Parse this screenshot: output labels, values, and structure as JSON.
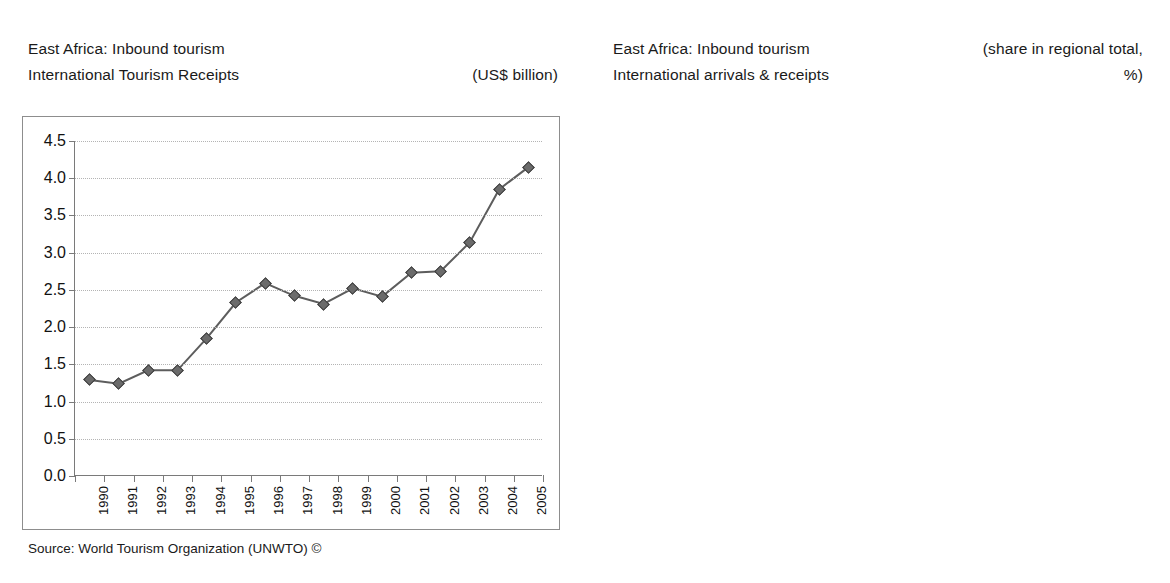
{
  "left_panel": {
    "title_line1": "East Africa: Inbound tourism",
    "title_line2": "International Tourism Receipts",
    "unit_line1": "",
    "unit_line2": "(US$ billion)",
    "source": "Source: World Tourism Organization (UNWTO) ©"
  },
  "right_panel": {
    "title_line1": "East Africa: Inbound tourism",
    "title_line2": "International arrivals & receipts",
    "unit_line1": "(share in regional total,",
    "unit_line2": "%)",
    "source": "Source: World Tourism Organization (UNWTO) ©"
  },
  "chart_data": [
    {
      "type": "line",
      "title": "East Africa: Inbound tourism — International Tourism Receipts",
      "xlabel": "",
      "ylabel": "(US$ billion)",
      "ylim": [
        0.0,
        4.5
      ],
      "ytick_labels": [
        "0.0",
        "0.5",
        "1.0",
        "1.5",
        "2.0",
        "2.5",
        "3.0",
        "3.5",
        "4.0",
        "4.5"
      ],
      "ytick_values": [
        0.0,
        0.5,
        1.0,
        1.5,
        2.0,
        2.5,
        3.0,
        3.5,
        4.0,
        4.5
      ],
      "grid": true,
      "legend": "none",
      "marker": "diamond",
      "categories": [
        "1990",
        "1991",
        "1992",
        "1993",
        "1994",
        "1995",
        "1996",
        "1997",
        "1998",
        "1999",
        "2000",
        "2001",
        "2002",
        "2003",
        "2004",
        "2005"
      ],
      "values": [
        1.29,
        1.24,
        1.42,
        1.42,
        1.85,
        2.33,
        2.59,
        2.42,
        2.31,
        2.52,
        2.41,
        2.73,
        2.75,
        3.14,
        3.85,
        4.15
      ]
    },
    {
      "type": "bar",
      "title": "East Africa: Inbound tourism — International arrivals & receipts",
      "xlabel": "",
      "ylabel": "(share in regional total, %)",
      "ylim": [
        0,
        25
      ],
      "ytick_labels": [
        "0",
        "5",
        "10",
        "15",
        "20",
        "25"
      ],
      "ytick_values": [
        0,
        5,
        10,
        15,
        20,
        25
      ],
      "grid": true,
      "legend": "inside-left",
      "categories": [
        "International Tourist Arrivals",
        "International Tourism Receipts"
      ],
      "series": [
        {
          "name": "2000",
          "values": [
            22.7,
            22.8
          ]
        },
        {
          "name": "2005*",
          "values": [
            21.6,
            18.8
          ]
        }
      ],
      "data_labels": [
        "22.7",
        "21.6",
        "22.8",
        "18.8"
      ]
    }
  ]
}
